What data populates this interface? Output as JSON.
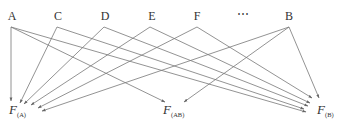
{
  "diagram": {
    "sources": [
      {
        "id": "A",
        "label": "A"
      },
      {
        "id": "C",
        "label": "C"
      },
      {
        "id": "D",
        "label": "D"
      },
      {
        "id": "E",
        "label": "E"
      },
      {
        "id": "F",
        "label": "F"
      },
      {
        "id": "ellipsis",
        "label": "⋯"
      },
      {
        "id": "B",
        "label": "B"
      }
    ],
    "targets": [
      {
        "id": "FA",
        "main": "F",
        "sub": "(A)"
      },
      {
        "id": "FAB",
        "main": "F",
        "sub": "(AB)"
      },
      {
        "id": "FB",
        "main": "F",
        "sub": "(B)"
      }
    ],
    "edges": [
      {
        "from": "A",
        "to": "FA"
      },
      {
        "from": "A",
        "to": "FAB"
      },
      {
        "from": "A",
        "to": "FB"
      },
      {
        "from": "C",
        "to": "FA"
      },
      {
        "from": "C",
        "to": "FB"
      },
      {
        "from": "D",
        "to": "FA"
      },
      {
        "from": "D",
        "to": "FB"
      },
      {
        "from": "E",
        "to": "FA"
      },
      {
        "from": "E",
        "to": "FB"
      },
      {
        "from": "F",
        "to": "FA"
      },
      {
        "from": "F",
        "to": "FB"
      },
      {
        "from": "B",
        "to": "FA"
      },
      {
        "from": "B",
        "to": "FAB"
      },
      {
        "from": "B",
        "to": "FB"
      }
    ]
  }
}
